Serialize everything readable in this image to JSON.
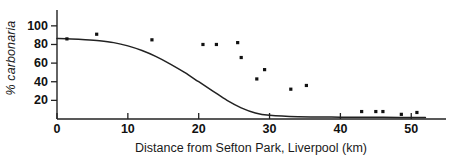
{
  "chart_data": {
    "type": "scatter",
    "title": "",
    "xlabel": "Distance from Sefton Park, Liverpool (km)",
    "ylabel": "% carbonaria",
    "xlim": [
      -1.5,
      54
    ],
    "ylim": [
      0,
      108
    ],
    "xticks": [
      0,
      10,
      20,
      30,
      40,
      50
    ],
    "xtick_labels": [
      "0",
      "10",
      "20",
      "30",
      "40",
      "50"
    ],
    "yticks": [
      20,
      40,
      60,
      80,
      100
    ],
    "ytick_labels": [
      "20",
      "40",
      "60",
      "80",
      "100"
    ],
    "grid": false,
    "legend": false,
    "series": [
      {
        "name": "observed % carbonaria",
        "marker": "square-dot",
        "color": "#111111",
        "points": [
          {
            "x": 1.4,
            "y": 86
          },
          {
            "x": 5.6,
            "y": 91
          },
          {
            "x": 13.4,
            "y": 85
          },
          {
            "x": 20.6,
            "y": 80
          },
          {
            "x": 22.5,
            "y": 80
          },
          {
            "x": 25.5,
            "y": 82
          },
          {
            "x": 26.0,
            "y": 66
          },
          {
            "x": 29.3,
            "y": 53
          },
          {
            "x": 28.2,
            "y": 43
          },
          {
            "x": 33.0,
            "y": 32
          },
          {
            "x": 35.2,
            "y": 36
          },
          {
            "x": 43.0,
            "y": 8
          },
          {
            "x": 45.0,
            "y": 8
          },
          {
            "x": 46.0,
            "y": 8
          },
          {
            "x": 48.6,
            "y": 5
          },
          {
            "x": 50.8,
            "y": 7
          }
        ]
      }
    ],
    "fitted_curve": {
      "name": "fitted cline (logistic)",
      "color": "#222222",
      "points": [
        {
          "x": 0.0,
          "y": 86.5
        },
        {
          "x": 2.0,
          "y": 86.0
        },
        {
          "x": 4.0,
          "y": 85.2
        },
        {
          "x": 6.0,
          "y": 84.0
        },
        {
          "x": 8.0,
          "y": 82.0
        },
        {
          "x": 10.0,
          "y": 78.5
        },
        {
          "x": 12.0,
          "y": 73.5
        },
        {
          "x": 14.0,
          "y": 67.0
        },
        {
          "x": 16.0,
          "y": 59.0
        },
        {
          "x": 18.0,
          "y": 50.0
        },
        {
          "x": 20.0,
          "y": 40.0
        },
        {
          "x": 22.0,
          "y": 30.0
        },
        {
          "x": 24.0,
          "y": 20.0
        },
        {
          "x": 26.0,
          "y": 12.0
        },
        {
          "x": 28.0,
          "y": 6.5
        },
        {
          "x": 30.0,
          "y": 4.0
        },
        {
          "x": 34.0,
          "y": 2.5
        },
        {
          "x": 40.0,
          "y": 2.0
        },
        {
          "x": 46.0,
          "y": 1.8
        },
        {
          "x": 52.0,
          "y": 1.6
        }
      ]
    }
  },
  "axes": {
    "xlabel": "Distance from Sefton Park, Liverpool (km)",
    "ylabel": "% carbonaria"
  }
}
